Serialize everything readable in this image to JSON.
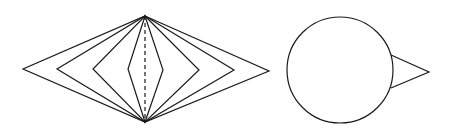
{
  "figure": {
    "width": 453,
    "height": 134,
    "stroke_color": "#1a1a1a",
    "background": "#ffffff",
    "left_shape": {
      "description": "nested rhombi sharing top and bottom vertices with dashed vertical axis",
      "top_apex": [
        145,
        16
      ],
      "bottom_apex": [
        145,
        122
      ],
      "rhombi": [
        {
          "left": [
            23,
            69
          ],
          "right": [
            269,
            71
          ]
        },
        {
          "left": [
            57,
            69
          ],
          "right": [
            234,
            70
          ]
        },
        {
          "left": [
            93,
            69
          ],
          "right": [
            199,
            70
          ]
        },
        {
          "left": [
            128,
            69
          ],
          "right": [
            163,
            70
          ]
        }
      ],
      "axis_style": "dashed"
    },
    "right_shape": {
      "description": "circle with triangular pointer to the right",
      "circle": {
        "cx": 340,
        "cy": 70,
        "r": 53
      },
      "triangle": {
        "base_top": [
          391,
          55
        ],
        "base_bottom": [
          391,
          88
        ],
        "tip": [
          429,
          72
        ]
      }
    }
  }
}
